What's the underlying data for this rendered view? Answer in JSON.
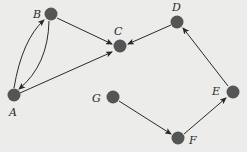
{
  "diagram": {
    "type": "directed-graph",
    "node_color": "#555555",
    "edge_color": "#2a2a2a",
    "background": "#ececea",
    "nodes": [
      {
        "id": "A",
        "label": "A",
        "x": 14,
        "y": 95,
        "lx": 9,
        "ly": 116
      },
      {
        "id": "B",
        "label": "B",
        "x": 51,
        "y": 14,
        "lx": 33,
        "ly": 18
      },
      {
        "id": "C",
        "label": "C",
        "x": 120,
        "y": 46,
        "lx": 114,
        "ly": 35
      },
      {
        "id": "D",
        "label": "D",
        "x": 177,
        "y": 22,
        "lx": 172,
        "ly": 11
      },
      {
        "id": "E",
        "label": "E",
        "x": 233,
        "y": 92,
        "lx": 212,
        "ly": 95
      },
      {
        "id": "F",
        "label": "F",
        "x": 178,
        "y": 138,
        "lx": 189,
        "ly": 144
      },
      {
        "id": "G",
        "label": "G",
        "x": 113,
        "y": 97,
        "lx": 92,
        "ly": 102
      }
    ],
    "edges": [
      {
        "from": "A",
        "to": "B"
      },
      {
        "from": "B",
        "to": "A"
      },
      {
        "from": "B",
        "to": "C"
      },
      {
        "from": "A",
        "to": "C"
      },
      {
        "from": "D",
        "to": "C"
      },
      {
        "from": "E",
        "to": "D"
      },
      {
        "from": "F",
        "to": "E"
      },
      {
        "from": "G",
        "to": "F"
      }
    ]
  }
}
